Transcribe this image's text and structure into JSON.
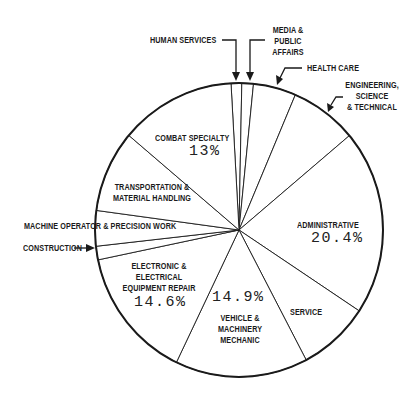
{
  "chart_data": {
    "type": "pie",
    "title": "",
    "start_angle_deg": -3.2,
    "direction": "clockwise",
    "slices": [
      {
        "label": "Human Services",
        "value": 1.2,
        "shown_value": ""
      },
      {
        "label": "Media & Public Affairs",
        "value": 1.3,
        "shown_value": ""
      },
      {
        "label": "Health Care",
        "value": 4.8,
        "shown_value": ""
      },
      {
        "label": "Engineering, Science & Technical",
        "value": 7.5,
        "shown_value": ""
      },
      {
        "label": "Administrative",
        "value": 20.4,
        "shown_value": "20.4%"
      },
      {
        "label": "Service",
        "value": 8.0,
        "shown_value": ""
      },
      {
        "label": "Vehicle & Machinery Mechanic",
        "value": 14.9,
        "shown_value": "14.9%"
      },
      {
        "label": "Electronic & Electrical Equipment Repair",
        "value": 14.6,
        "shown_value": "14.6%"
      },
      {
        "label": "Construction",
        "value": 1.5,
        "shown_value": ""
      },
      {
        "label": "Machine Operator & Precision Work",
        "value": 3.9,
        "shown_value": ""
      },
      {
        "label": "Transportation & Material Handling",
        "value": 9.0,
        "shown_value": ""
      },
      {
        "label": "Combat Specialty",
        "value": 13.0,
        "shown_value": "13%"
      }
    ],
    "colors": {
      "fill": "#ffffff",
      "stroke": "#1a1a1a"
    }
  },
  "labels": {
    "human_services": "HUMAN SERVICES",
    "media_1": "MEDIA &",
    "media_2": "PUBLIC",
    "media_3": "AFFAIRS",
    "health_care": "HEALTH CARE",
    "eng_1": "ENGINEERING,",
    "eng_2": "SCIENCE",
    "eng_3": "& TECHNICAL",
    "combat": "COMBAT SPECIALTY",
    "combat_pct": "13%",
    "transport_1": "TRANSPORTATION &",
    "transport_2": "MATERIAL HANDLING",
    "machine": "MACHINE OPERATOR & PRECISION WORK",
    "construction": "CONSTRUCTION",
    "electronic_1": "ELECTRONIC &",
    "electronic_2": "ELECTRICAL",
    "electronic_3": "EQUIPMENT REPAIR",
    "electronic_pct": "14.6%",
    "vehicle_pct": "14.9%",
    "vehicle_1": "VEHICLE &",
    "vehicle_2": "MACHINERY",
    "vehicle_3": "MECHANIC",
    "service": "SERVICE",
    "admin": "ADMINISTRATIVE",
    "admin_pct": "20.4%"
  }
}
